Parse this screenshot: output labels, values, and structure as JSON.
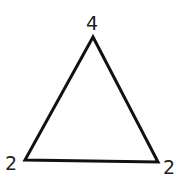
{
  "diagram": {
    "shape": "triangle",
    "stroke_color": "#111111",
    "vertices": [
      {
        "position": "top",
        "label": "4"
      },
      {
        "position": "bottom-left",
        "label": "2"
      },
      {
        "position": "bottom-right",
        "label": "2"
      }
    ]
  }
}
